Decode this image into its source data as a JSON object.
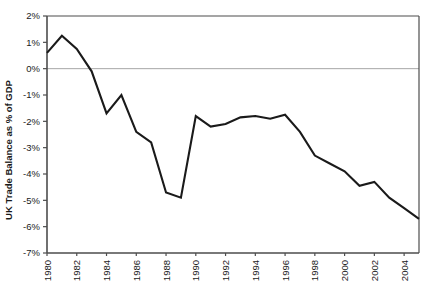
{
  "chart_data": {
    "type": "line",
    "title": "",
    "xlabel": "",
    "ylabel": "UK Trade Balance as % of GDP",
    "xlim": [
      1980,
      2005
    ],
    "ylim": [
      -7,
      2
    ],
    "ytick_labels": [
      "2%",
      "1%",
      "0%",
      "-1%",
      "-2%",
      "-3%",
      "-4%",
      "-5%",
      "-6%",
      "-7%"
    ],
    "ytick_values": [
      2,
      1,
      0,
      -1,
      -2,
      -3,
      -4,
      -5,
      -6,
      -7
    ],
    "xtick_labels": [
      "1980",
      "1982",
      "1984",
      "1986",
      "1988",
      "1990",
      "1992",
      "1994",
      "1996",
      "1998",
      "2000",
      "2002",
      "2004"
    ],
    "xtick_values": [
      1980,
      1982,
      1984,
      1986,
      1988,
      1990,
      1992,
      1994,
      1996,
      1998,
      2000,
      2002,
      2004
    ],
    "grid": false,
    "zero_line": true,
    "legend": "none",
    "series": [
      {
        "name": "UK Trade Balance as % of GDP",
        "color": "#1a1a1a",
        "x": [
          1980,
          1981,
          1982,
          1983,
          1984,
          1985,
          1986,
          1987,
          1988,
          1989,
          1990,
          1991,
          1992,
          1993,
          1994,
          1995,
          1996,
          1997,
          1998,
          1999,
          2000,
          2001,
          2002,
          2003,
          2004,
          2005
        ],
        "values": [
          0.6,
          1.25,
          0.75,
          -0.1,
          -1.7,
          -1.0,
          -2.4,
          -2.8,
          -4.7,
          -4.9,
          -1.8,
          -2.2,
          -2.1,
          -1.85,
          -1.8,
          -1.9,
          -1.75,
          -2.4,
          -3.3,
          -3.6,
          -3.9,
          -4.45,
          -4.3,
          -4.9,
          -5.3,
          -5.7
        ]
      }
    ]
  },
  "axis": {
    "y_title": "UK Trade Balance as % of GDP"
  },
  "colors": {
    "line": "#1a1a1a",
    "axis": "#4d4d4d",
    "zero_line": "#a6a6a6",
    "background": "#ffffff"
  }
}
